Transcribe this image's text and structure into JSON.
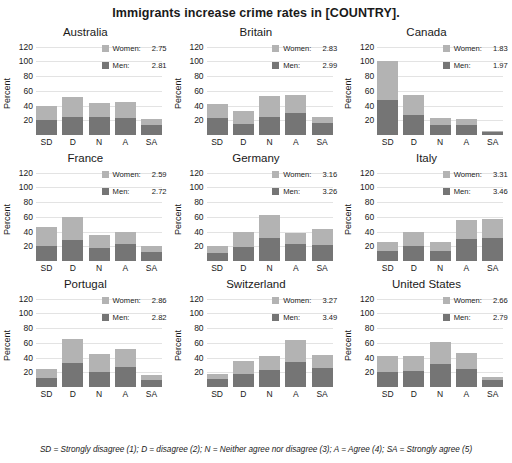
{
  "title": "Immigrants increase crime rates in [COUNTRY].",
  "footnote": "SD = Strongly disagree (1); D = disagree (2); N = Neither agree nor disagree (3); A = Agree (4); SA = Strongly agree (5)",
  "axis": {
    "ylabel": "Percent",
    "yticks": [
      120,
      100,
      80,
      60,
      40,
      20
    ],
    "ylim": [
      0,
      125
    ],
    "xticks": [
      "SD",
      "D",
      "N",
      "A",
      "SA"
    ]
  },
  "legend": {
    "women_label": "Women:",
    "men_label": "Men:",
    "women_color": "#b3b3b3",
    "men_color": "#757575"
  },
  "chart_data": {
    "type": "bar",
    "title": "Immigrants increase crime rates in [COUNTRY].",
    "xlabel": "",
    "ylabel": "Percent",
    "ylim": [
      0,
      125
    ],
    "yticks": [
      20,
      40,
      60,
      80,
      100,
      120
    ],
    "grid": true,
    "stacked": true,
    "legend_position": "top-right inside each panel",
    "categories": [
      "SD",
      "D",
      "N",
      "A",
      "SA"
    ],
    "category_meanings": {
      "SD": "Strongly disagree (1)",
      "D": "disagree (2)",
      "N": "Neither agree nor disagree (3)",
      "A": "Agree (4)",
      "SA": "Strongly agree (5)"
    },
    "series_names": [
      "Women",
      "Men"
    ],
    "panels": [
      {
        "name": "Australia",
        "women_mean": "2.75",
        "men_mean": "2.81",
        "series": [
          {
            "name": "Men",
            "values": [
              20,
              25,
              24,
              23,
              13
            ]
          },
          {
            "name": "Women",
            "values": [
              20,
              26,
              19,
              22,
              9
            ]
          }
        ],
        "totals": [
          40,
          51,
          43,
          45,
          22
        ]
      },
      {
        "name": "Britain",
        "women_mean": "2.83",
        "men_mean": "2.99",
        "series": [
          {
            "name": "Men",
            "values": [
              23,
              15,
              24,
              30,
              16
            ]
          },
          {
            "name": "Women",
            "values": [
              19,
              18,
              29,
              24,
              8
            ]
          }
        ],
        "totals": [
          42,
          33,
          53,
          54,
          24
        ]
      },
      {
        "name": "Canada",
        "women_mean": "1.83",
        "men_mean": "1.97",
        "series": [
          {
            "name": "Men",
            "values": [
              48,
              27,
              14,
              14,
              4
            ]
          },
          {
            "name": "Women",
            "values": [
              52,
              27,
              9,
              8,
              1
            ]
          }
        ],
        "totals": [
          100,
          54,
          23,
          22,
          5
        ]
      },
      {
        "name": "France",
        "women_mean": "2.59",
        "men_mean": "2.72",
        "series": [
          {
            "name": "Men",
            "values": [
              21,
              29,
              18,
              23,
              12
            ]
          },
          {
            "name": "Women",
            "values": [
              25,
              31,
              18,
              16,
              9
            ]
          }
        ],
        "totals": [
          46,
          60,
          36,
          39,
          21
        ]
      },
      {
        "name": "Germany",
        "women_mean": "3.16",
        "men_mean": "3.26",
        "series": [
          {
            "name": "Men",
            "values": [
              11,
              19,
              31,
              23,
              22
            ]
          },
          {
            "name": "Women",
            "values": [
              9,
              20,
              32,
              15,
              22
            ]
          }
        ],
        "totals": [
          20,
          39,
          63,
          38,
          44
        ]
      },
      {
        "name": "Italy",
        "women_mean": "3.31",
        "men_mean": "3.46",
        "series": [
          {
            "name": "Men",
            "values": [
              13,
              20,
              13,
              30,
              31
            ]
          },
          {
            "name": "Women",
            "values": [
              13,
              19,
              13,
              26,
              26
            ]
          }
        ],
        "totals": [
          26,
          39,
          26,
          56,
          57
        ]
      },
      {
        "name": "Portugal",
        "women_mean": "2.86",
        "men_mean": "2.82",
        "series": [
          {
            "name": "Men",
            "values": [
              12,
              33,
              21,
              27,
              9
            ]
          },
          {
            "name": "Women",
            "values": [
              12,
              32,
              24,
              25,
              7
            ]
          }
        ],
        "totals": [
          24,
          65,
          45,
          52,
          16
        ]
      },
      {
        "name": "Switzerland",
        "women_mean": "3.27",
        "men_mean": "3.49",
        "series": [
          {
            "name": "Men",
            "values": [
              11,
              18,
              23,
              34,
              26
            ]
          },
          {
            "name": "Women",
            "values": [
              7,
              17,
              19,
              30,
              18
            ]
          }
        ],
        "totals": [
          18,
          35,
          42,
          64,
          44
        ]
      },
      {
        "name": "United States",
        "women_mean": "2.66",
        "men_mean": "2.79",
        "series": [
          {
            "name": "Men",
            "values": [
              20,
              22,
              31,
              25,
              9
            ]
          },
          {
            "name": "Women",
            "values": [
              22,
              20,
              30,
              21,
              4
            ]
          }
        ],
        "totals": [
          42,
          42,
          61,
          46,
          13
        ]
      }
    ]
  }
}
